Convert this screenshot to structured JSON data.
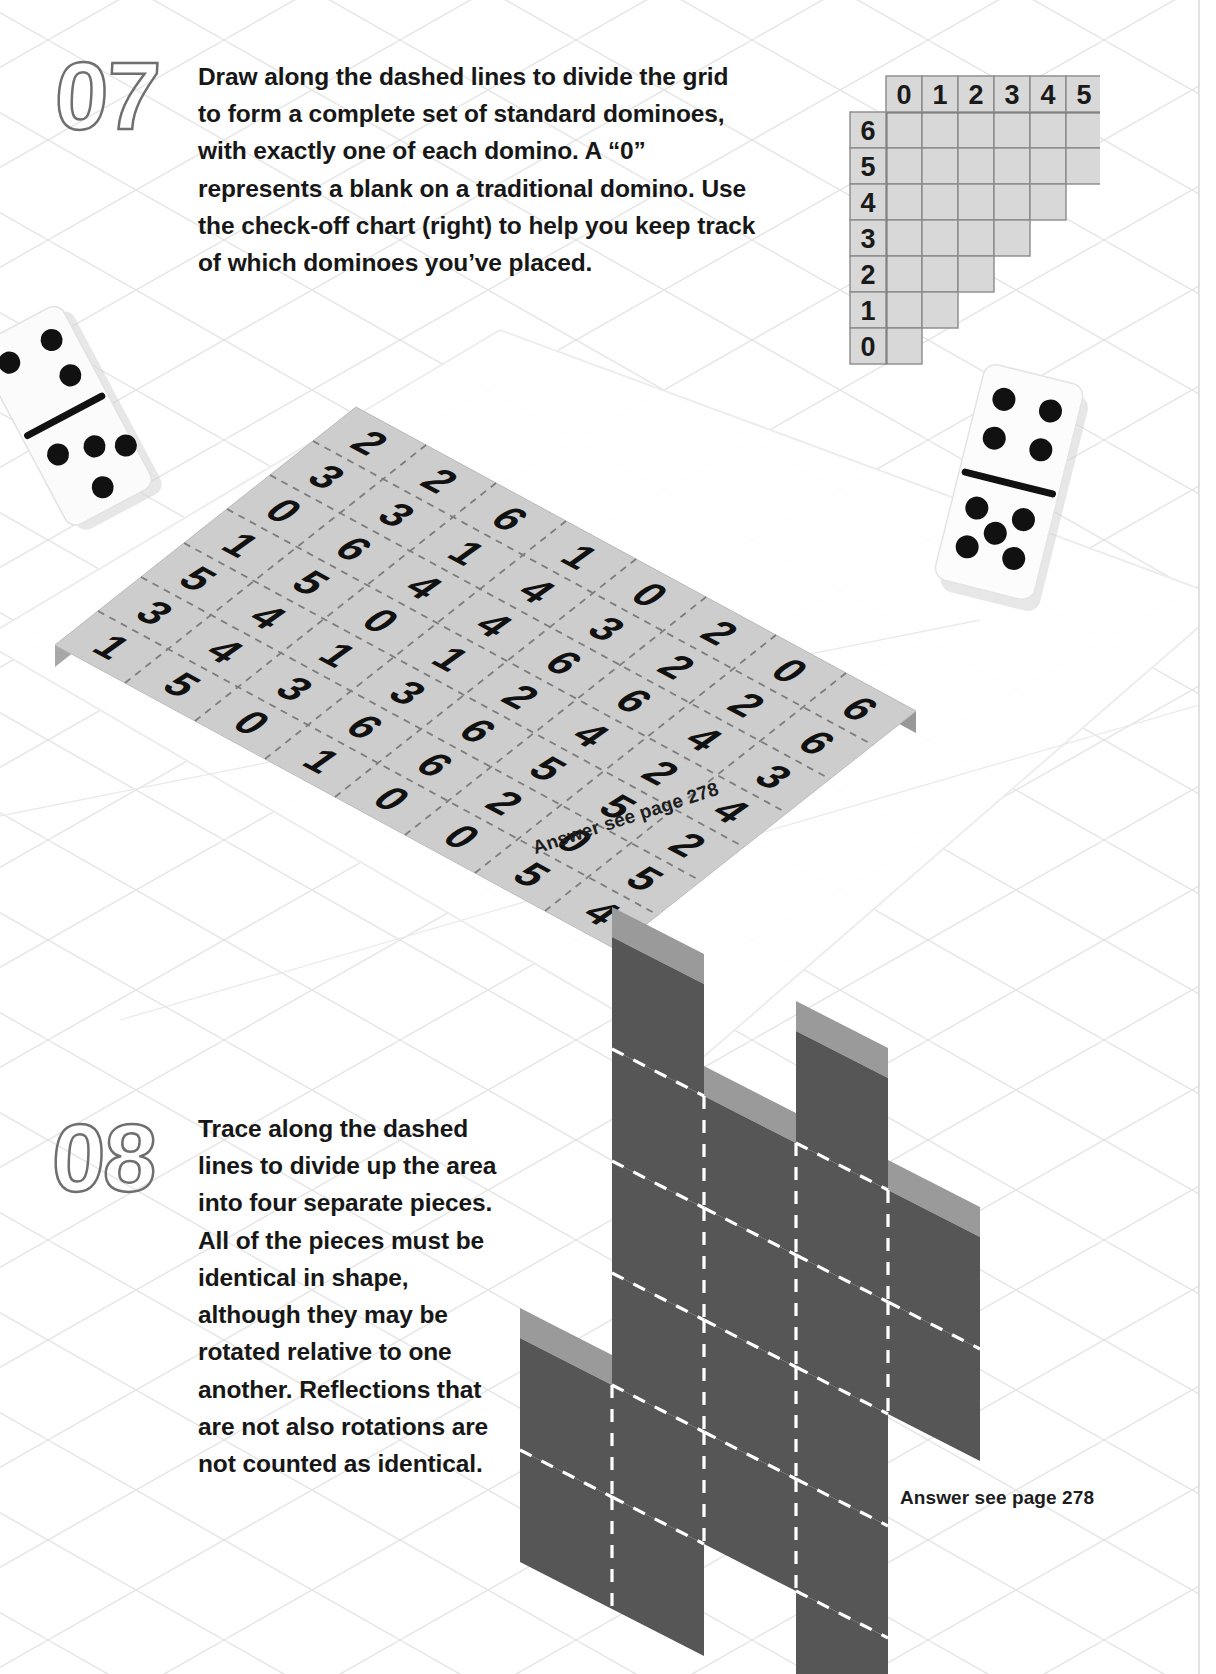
{
  "page": {
    "background_color": "#ffffff",
    "grid_line_color": "#e2e2e2"
  },
  "puzzles": [
    {
      "number": "07",
      "instruction": "Draw along the dashed lines to divide the grid to form a complete set of standard dominoes, with exactly one of each domino. A “0” represents a blank on a traditional domino. Use the check-off chart (right) to help you keep track of which dominoes you’ve placed.",
      "answer_note": "Answer see page 278"
    },
    {
      "number": "08",
      "instruction": "Trace along the dashed lines to divide up the area into four separate pieces. All of the pieces must be identical in shape, although they may be rotated relative to one another. Reflections that are not also rotations are not counted as identical.",
      "answer_note": "Answer see page 278"
    }
  ],
  "check_chart": {
    "column_headers": [
      "0",
      "1",
      "2",
      "3",
      "4",
      "5",
      "6"
    ],
    "row_headers": [
      "6",
      "5",
      "4",
      "3",
      "2",
      "1",
      "0"
    ],
    "row_cell_counts": [
      7,
      6,
      5,
      4,
      3,
      2,
      1
    ],
    "cell_fill": "#d8d8d8",
    "cell_border": "#8a8a8a"
  },
  "domino_grid": {
    "rows": 7,
    "cols": 8,
    "surface_color": "#cdcdcd",
    "dash_color": "#7d7d7d",
    "values": [
      [
        1,
        5,
        0,
        1,
        0,
        0,
        5,
        4
      ],
      [
        3,
        4,
        3,
        6,
        6,
        2,
        0,
        5
      ],
      [
        5,
        4,
        1,
        3,
        6,
        5,
        5,
        2
      ],
      [
        1,
        5,
        0,
        1,
        2,
        4,
        2,
        4
      ],
      [
        0,
        6,
        4,
        4,
        6,
        6,
        4,
        3
      ],
      [
        3,
        3,
        1,
        4,
        3,
        2,
        2,
        6
      ],
      [
        2,
        2,
        6,
        1,
        0,
        2,
        0,
        6
      ]
    ]
  },
  "decor_dominoes": [
    {
      "name": "domino-five-six",
      "top_pips": 3,
      "bottom_pips": 4
    },
    {
      "name": "domino-six-six",
      "top_pips": 4,
      "bottom_pips": 5
    }
  ],
  "iso_shape": {
    "fill": "#565656",
    "top_face": "#9a9a9a",
    "dash_color": "#ffffff",
    "piece_count": 4
  }
}
